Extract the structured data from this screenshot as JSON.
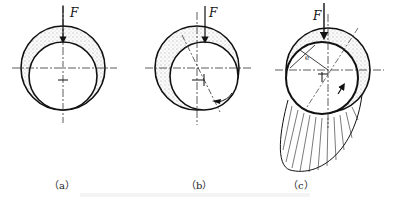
{
  "figure": {
    "panels": [
      {
        "id": "a",
        "caption": "（a）",
        "force_label": "F"
      },
      {
        "id": "b",
        "caption": "（b）",
        "force_label": "F"
      },
      {
        "id": "c",
        "caption": "（c）",
        "force_label": "F",
        "eccentricity_label": "e"
      }
    ]
  },
  "colors": {
    "line": "#111111",
    "hatch_fill": "#e8e8e8"
  }
}
